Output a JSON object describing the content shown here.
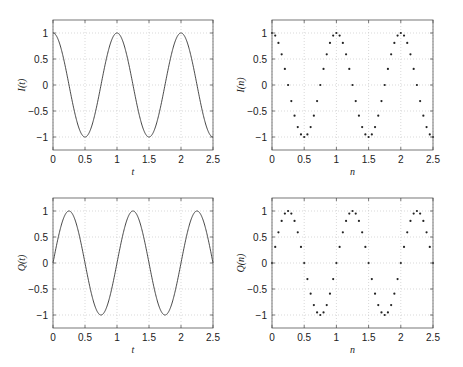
{
  "chart_data": [
    {
      "id": "I_t",
      "type": "line",
      "position": "top-left",
      "title": "",
      "xlabel": "t",
      "ylabel": "I(t)",
      "function": "cos(2*pi*t)",
      "xlim": [
        0,
        2.5
      ],
      "ylim": [
        -1.25,
        1.25
      ],
      "xticks": [
        0,
        0.5,
        1,
        1.5,
        2,
        2.5
      ],
      "xtick_labels": [
        "0",
        "0.5",
        "1",
        "1.5",
        "2",
        "2.5"
      ],
      "yticks": [
        1,
        0.5,
        0,
        -0.5,
        -1
      ],
      "ytick_labels": [
        "1",
        "0.5",
        "0",
        "−0.5",
        "−1"
      ],
      "grid": true,
      "key_points": {
        "x": [
          0,
          0.5,
          1,
          1.5,
          2,
          2.5
        ],
        "y": [
          1,
          -1,
          1,
          -1,
          1,
          -1
        ]
      }
    },
    {
      "id": "I_n",
      "type": "scatter",
      "position": "top-right",
      "title": "",
      "xlabel": "n",
      "ylabel": "I(n)",
      "function": "cos(2*pi*n)",
      "sample_step": 0.05,
      "xlim": [
        0,
        2.5
      ],
      "ylim": [
        -1.25,
        1.25
      ],
      "xticks": [
        0,
        0.5,
        1,
        1.5,
        2,
        2.5
      ],
      "xtick_labels": [
        "0",
        "0.5",
        "1",
        "1.5",
        "2",
        "2.5"
      ],
      "yticks": [
        1,
        0.5,
        0,
        -0.5,
        -1
      ],
      "ytick_labels": [
        "1",
        "0.5",
        "0",
        "−0.5",
        "−1"
      ],
      "grid": true,
      "x": [
        0,
        0.05,
        0.1,
        0.15,
        0.2,
        0.25,
        0.3,
        0.35,
        0.4,
        0.45,
        0.5,
        0.55,
        0.6,
        0.65,
        0.7,
        0.75,
        0.8,
        0.85,
        0.9,
        0.95,
        1,
        1.05,
        1.1,
        1.15,
        1.2,
        1.25,
        1.3,
        1.35,
        1.4,
        1.45,
        1.5,
        1.55,
        1.6,
        1.65,
        1.7,
        1.75,
        1.8,
        1.85,
        1.9,
        1.95,
        2,
        2.05,
        2.1,
        2.15,
        2.2,
        2.25,
        2.3,
        2.35,
        2.4,
        2.45,
        2.5
      ],
      "y": [
        1,
        0.95,
        0.81,
        0.59,
        0.31,
        0,
        -0.31,
        -0.59,
        -0.81,
        -0.95,
        -1,
        -0.95,
        -0.81,
        -0.59,
        -0.31,
        0,
        0.31,
        0.59,
        0.81,
        0.95,
        1,
        0.95,
        0.81,
        0.59,
        0.31,
        0,
        -0.31,
        -0.59,
        -0.81,
        -0.95,
        -1,
        -0.95,
        -0.81,
        -0.59,
        -0.31,
        0,
        0.31,
        0.59,
        0.81,
        0.95,
        1,
        0.95,
        0.81,
        0.59,
        0.31,
        0,
        -0.31,
        -0.59,
        -0.81,
        -0.95,
        -1
      ]
    },
    {
      "id": "Q_t",
      "type": "line",
      "position": "bottom-left",
      "title": "",
      "xlabel": "t",
      "ylabel": "Q(t)",
      "function": "sin(2*pi*t)",
      "xlim": [
        0,
        2.5
      ],
      "ylim": [
        -1.25,
        1.25
      ],
      "xticks": [
        0,
        0.5,
        1,
        1.5,
        2,
        2.5
      ],
      "xtick_labels": [
        "0",
        "0.5",
        "1",
        "1.5",
        "2",
        "2.5"
      ],
      "yticks": [
        1,
        0.5,
        0,
        -0.5,
        -1
      ],
      "ytick_labels": [
        "1",
        "0.5",
        "0",
        "−0.5",
        "−1"
      ],
      "grid": true,
      "key_points": {
        "x": [
          0,
          0.25,
          0.75,
          1.25,
          1.75,
          2.25,
          2.5
        ],
        "y": [
          0,
          1,
          -1,
          1,
          -1,
          1,
          0
        ]
      }
    },
    {
      "id": "Q_n",
      "type": "scatter",
      "position": "bottom-right",
      "title": "",
      "xlabel": "n",
      "ylabel": "Q(n)",
      "function": "sin(2*pi*n)",
      "sample_step": 0.05,
      "xlim": [
        0,
        2.5
      ],
      "ylim": [
        -1.25,
        1.25
      ],
      "xticks": [
        0,
        0.5,
        1,
        1.5,
        2,
        2.5
      ],
      "xtick_labels": [
        "0",
        "0.5",
        "1",
        "1.5",
        "2",
        "2.5"
      ],
      "yticks": [
        1,
        0.5,
        0,
        -0.5,
        -1
      ],
      "ytick_labels": [
        "1",
        "0.5",
        "0",
        "−0.5",
        "−1"
      ],
      "grid": true,
      "x": [
        0,
        0.05,
        0.1,
        0.15,
        0.2,
        0.25,
        0.3,
        0.35,
        0.4,
        0.45,
        0.5,
        0.55,
        0.6,
        0.65,
        0.7,
        0.75,
        0.8,
        0.85,
        0.9,
        0.95,
        1,
        1.05,
        1.1,
        1.15,
        1.2,
        1.25,
        1.3,
        1.35,
        1.4,
        1.45,
        1.5,
        1.55,
        1.6,
        1.65,
        1.7,
        1.75,
        1.8,
        1.85,
        1.9,
        1.95,
        2,
        2.05,
        2.1,
        2.15,
        2.2,
        2.25,
        2.3,
        2.35,
        2.4,
        2.45,
        2.5
      ],
      "y": [
        0,
        0.31,
        0.59,
        0.81,
        0.95,
        1,
        0.95,
        0.81,
        0.59,
        0.31,
        0,
        -0.31,
        -0.59,
        -0.81,
        -0.95,
        -1,
        -0.95,
        -0.81,
        -0.59,
        -0.31,
        0,
        0.31,
        0.59,
        0.81,
        0.95,
        1,
        0.95,
        0.81,
        0.59,
        0.31,
        0,
        -0.31,
        -0.59,
        -0.81,
        -0.95,
        -1,
        -0.95,
        -0.81,
        -0.59,
        -0.31,
        0,
        0.31,
        0.59,
        0.81,
        0.95,
        1,
        0.95,
        0.81,
        0.59,
        0.31,
        0
      ]
    }
  ],
  "style": {
    "line_color": "#333333",
    "marker_color": "#222222",
    "grid_color": "#c8c8c8",
    "axes_color": "#555555"
  }
}
